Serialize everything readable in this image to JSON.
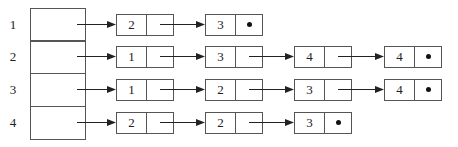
{
  "diagram": {
    "type": "adjacency-list",
    "rows": [
      {
        "label": "1",
        "nodes": [
          "2",
          "3"
        ]
      },
      {
        "label": "2",
        "nodes": [
          "1",
          "3",
          "4",
          "4"
        ]
      },
      {
        "label": "3",
        "nodes": [
          "1",
          "2",
          "3",
          "4"
        ]
      },
      {
        "label": "4",
        "nodes": [
          "2",
          "2",
          "3"
        ]
      }
    ],
    "null_marker": "•"
  }
}
